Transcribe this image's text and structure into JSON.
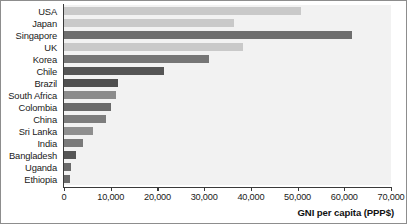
{
  "chart_data": {
    "type": "bar",
    "orientation": "horizontal",
    "title": "",
    "xlabel": "GNI per capita (PPP$)",
    "ylabel": "",
    "xlim": [
      0,
      70000
    ],
    "xticks": [
      "0",
      "10,000",
      "20,000",
      "30,000",
      "40,000",
      "50,000",
      "60,000",
      "70,000"
    ],
    "xtick_values": [
      0,
      10000,
      20000,
      30000,
      40000,
      50000,
      60000,
      70000
    ],
    "grid": false,
    "legend": "none",
    "categories": [
      "USA",
      "Japan",
      "Singapore",
      "UK",
      "Korea",
      "Chile",
      "Brazil",
      "South Africa",
      "Colombia",
      "China",
      "Sri Lanka",
      "India",
      "Bangladesh",
      "Uganda",
      "Ethiopia"
    ],
    "values": [
      50700,
      36400,
      61700,
      38300,
      31000,
      21400,
      11600,
      11100,
      10100,
      9000,
      6200,
      4100,
      2600,
      1400,
      1200
    ],
    "bar_colors": [
      "#c9c9c9",
      "#c9c9c9",
      "#6e6e6e",
      "#c9c9c9",
      "#767676",
      "#555555",
      "#4f4f4f",
      "#8b8b8b",
      "#6a6a6a",
      "#7d7d7d",
      "#8f8f8f",
      "#7a7a7a",
      "#555555",
      "#6a6a6a",
      "#6a6a6a"
    ],
    "plot_background": "#f2f2f2",
    "axis_color": "#3a3a3a"
  }
}
